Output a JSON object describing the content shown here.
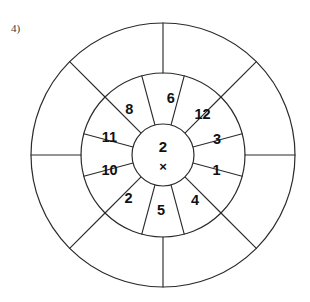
{
  "page": {
    "background_color": "#ffffff",
    "line_color": "#2b2b2b",
    "text_color": "#111111"
  },
  "problem": {
    "label": "4)"
  },
  "wheel": {
    "center": {
      "cx": 163,
      "cy": 155
    },
    "radii": {
      "inner": 31,
      "middle": 82,
      "outer": 132
    },
    "center_cell": {
      "multiplier": "2",
      "operator": "×"
    },
    "inner_ring": {
      "sector_count": 12,
      "sector_degrees": 30,
      "label_radius": 56,
      "cells": [
        {
          "name": "inner-sector-3",
          "value": "3",
          "angle_deg": 15
        },
        {
          "name": "inner-sector-12",
          "value": "12",
          "angle_deg": 45
        },
        {
          "name": "inner-sector-6",
          "value": "6",
          "angle_deg": 82
        },
        {
          "name": "inner-sector-8",
          "value": "8",
          "angle_deg": 127
        },
        {
          "name": "inner-sector-11",
          "value": "11",
          "angle_deg": 163
        },
        {
          "name": "inner-sector-10",
          "value": "10",
          "angle_deg": 197
        },
        {
          "name": "inner-sector-2",
          "value": "2",
          "angle_deg": 232
        },
        {
          "name": "inner-sector-5",
          "value": "5",
          "angle_deg": 268
        },
        {
          "name": "inner-sector-4",
          "value": "4",
          "angle_deg": 305
        },
        {
          "name": "inner-sector-1",
          "value": "1",
          "angle_deg": 343
        }
      ],
      "spoke_angles_deg": [
        15,
        45,
        75,
        105,
        135,
        165,
        195,
        225,
        255,
        285,
        315,
        345
      ]
    },
    "outer_ring": {
      "sector_count": 8,
      "sector_degrees": 45,
      "answers": [
        "",
        "",
        "",
        "",
        "",
        "",
        "",
        ""
      ],
      "spoke_angles_deg": [
        0,
        45,
        90,
        135,
        180,
        225,
        270,
        315
      ]
    }
  }
}
